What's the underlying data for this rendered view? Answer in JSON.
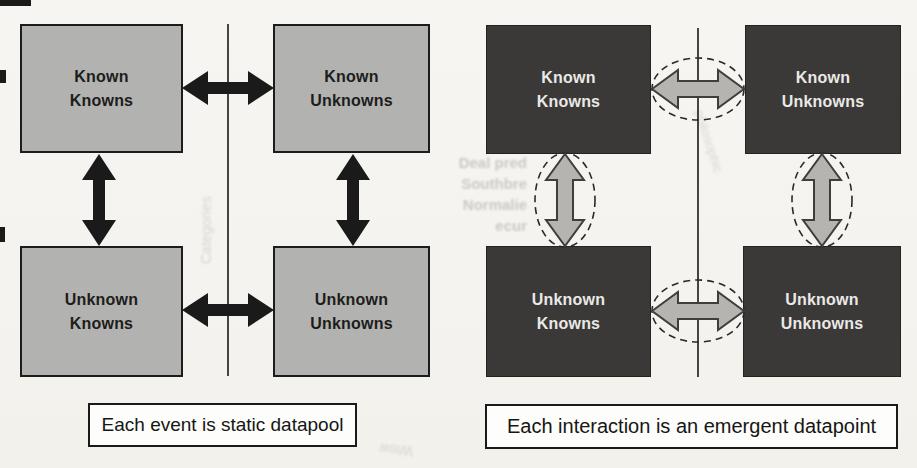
{
  "figure": {
    "background": "#f5f4f0",
    "left": {
      "boxes": [
        {
          "id": "known-knowns",
          "line1": "Known",
          "line2": "Knowns"
        },
        {
          "id": "known-unknowns",
          "line1": "Known",
          "line2": "Unknowns"
        },
        {
          "id": "unknown-knowns",
          "line1": "Unknown",
          "line2": "Knowns"
        },
        {
          "id": "unknown-unknowns",
          "line1": "Unknown",
          "line2": "Unknowns"
        }
      ],
      "caption": "Each event is static datapool",
      "style": {
        "box_fill": "#b2b2b0",
        "box_border": "#1c1c1c",
        "box_text": "#1d1d1b",
        "arrow_color": "#1a1a1a",
        "divider_color": "#454442"
      }
    },
    "right": {
      "boxes": [
        {
          "id": "known-knowns",
          "line1": "Known",
          "line2": "Knowns"
        },
        {
          "id": "known-unknowns",
          "line1": "Known",
          "line2": "Unknowns"
        },
        {
          "id": "unknown-knowns",
          "line1": "Unknown",
          "line2": "Knowns"
        },
        {
          "id": "unknown-unknowns",
          "line1": "Unknown",
          "line2": "Unknowns"
        }
      ],
      "caption": "Each interaction is an emergent datapoint",
      "style": {
        "box_fill": "#3a3938",
        "box_text": "#eae9e6",
        "arrow_fill": "#b5b4b1",
        "arrow_outline": "#3f3e3c",
        "ellipse_stroke": "#2b2a28",
        "divider_color": "#454442"
      }
    }
  },
  "bleedthrough": {
    "lines": [
      "Deal pred",
      "Southbre",
      "Normalie",
      "ecur"
    ],
    "vertical_text": "Categories",
    "diagonal_text": "philosophic",
    "bottom_mirrored_text": "Wisw"
  }
}
